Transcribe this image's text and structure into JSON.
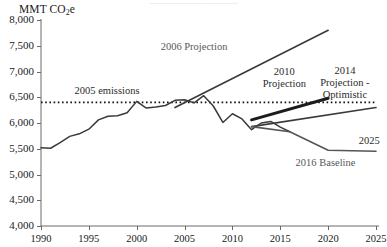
{
  "header": {
    "cropped_top_text": "—————————————————"
  },
  "chart_data": {
    "type": "line",
    "title": "",
    "subtitle": "",
    "ylabel": "MMT CO2e",
    "ylabel_rich": {
      "prefix": "MMT CO",
      "sub": "2",
      "suffix": "e"
    },
    "xlabel": "",
    "xlim": [
      1990,
      2025
    ],
    "ylim": [
      4000,
      8000
    ],
    "ytick_values": [
      8000,
      7500,
      7000,
      6500,
      6000,
      5500,
      5000,
      4500,
      4000
    ],
    "ytick_labels": [
      "8,000",
      "7,500",
      "7,000",
      "6,500",
      "6,000",
      "5,500",
      "5,000",
      "4,500",
      "4,000"
    ],
    "xtick_values": [
      1990,
      1995,
      2000,
      2005,
      2010,
      2015,
      2020,
      2025
    ],
    "xtick_labels": [
      "1990",
      "1995",
      "2000",
      "2005",
      "2010",
      "2015",
      "2020",
      "2025"
    ],
    "grid": false,
    "legend_position": "inline-annotations",
    "line_color": "#333333",
    "reference_line": {
      "name": "2005 emissions",
      "label": "2005 emissions",
      "value": 6400,
      "style": "dotted",
      "x_start": 1990,
      "x_end": 2025,
      "label_x": 1993.5,
      "label_y": 6620
    },
    "series": [
      {
        "name": "historical-emissions",
        "label": "",
        "style": "solid",
        "width": 1.5,
        "color": "#3a3a3a",
        "x": [
          1990,
          1991,
          1992,
          1993,
          1994,
          1995,
          1996,
          1997,
          1998,
          1999,
          2000,
          2001,
          2002,
          2003,
          2004,
          2005,
          2006,
          2007,
          2008,
          2009,
          2010,
          2011,
          2012,
          2013,
          2014,
          2015,
          2016
        ],
        "values": [
          5520,
          5510,
          5620,
          5740,
          5790,
          5880,
          6060,
          6130,
          6140,
          6200,
          6420,
          6290,
          6310,
          6340,
          6440,
          6450,
          6390,
          6530,
          6330,
          6010,
          6180,
          6080,
          5870,
          6000,
          6030,
          5920,
          5830
        ]
      },
      {
        "name": "2006-projection",
        "label": "2006 Projection",
        "style": "solid",
        "width": 1.6,
        "color": "#3a3a3a",
        "x": [
          2004,
          2020
        ],
        "values": [
          6300,
          7800
        ],
        "label_x": 2002.5,
        "label_y": 7480
      },
      {
        "name": "2010-projection",
        "label": "2010 Projection",
        "style": "solid",
        "width": 3.0,
        "color": "#1c1c1c",
        "x": [
          2012,
          2020
        ],
        "values": [
          6060,
          6480
        ],
        "label_x": 2012.6,
        "label_y": 7000
      },
      {
        "name": "2014-projection-optimistic",
        "label": "2014 Projection - Optimistic",
        "style": "solid",
        "width": 1.6,
        "color": "#3a3a3a",
        "x": [
          2012,
          2025
        ],
        "values": [
          5930,
          6300
        ],
        "label_x": 2018.2,
        "label_y": 7010
      },
      {
        "name": "2016-baseline",
        "label": "2016 Baseline",
        "style": "solid",
        "width": 1.6,
        "color": "#555555",
        "x": [
          2012,
          2016,
          2020,
          2025
        ],
        "values": [
          5930,
          5830,
          5470,
          5450
        ],
        "label_x": 2016.6,
        "label_y": 5220
      }
    ],
    "annotations": [
      {
        "name": "year-2025-callout",
        "text": "2025",
        "x": 2023.2,
        "y": 5660
      }
    ]
  }
}
